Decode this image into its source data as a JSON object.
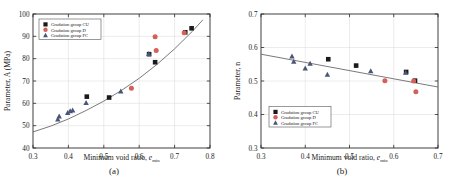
{
  "figure": {
    "panels": [
      {
        "id": "a",
        "caption": "(a)",
        "xlabel_main": "Minimum void ratio, ",
        "xlabel_sym": "e",
        "xlabel_sub": "min",
        "ylabel": "Parameter, A (MPa)",
        "xticks": [
          "0.3",
          "0.4",
          "0.5",
          "0.6",
          "0.7",
          "0.8"
        ],
        "yticks": [
          "40",
          "50",
          "60",
          "70",
          "80",
          "90",
          "100"
        ],
        "legend": [
          {
            "label": "Gradation group CU",
            "marker": "square",
            "color": "#1a1a1a"
          },
          {
            "label": "Gradation group D",
            "marker": "circle",
            "color": "#d4605a"
          },
          {
            "label": "Gradation group FC",
            "marker": "triangle",
            "color": "#4a5578"
          }
        ]
      },
      {
        "id": "b",
        "caption": "(b)",
        "xlabel_main": "Minimum void ratio, ",
        "xlabel_sym": "e",
        "xlabel_sub": "min",
        "ylabel": "Parameter, n",
        "xticks": [
          "0.3",
          "0.4",
          "0.5",
          "0.6",
          "0.7"
        ],
        "yticks": [
          "0.3",
          "0.4",
          "0.5",
          "0.6",
          "0.7"
        ],
        "legend": [
          {
            "label": "Gradation group CU",
            "marker": "square",
            "color": "#1a1a1a"
          },
          {
            "label": "Gradation group D",
            "marker": "circle",
            "color": "#d4605a"
          },
          {
            "label": "Gradation group FC",
            "marker": "triangle",
            "color": "#4a5578"
          }
        ]
      }
    ]
  },
  "chart_data": [
    {
      "type": "scatter",
      "panel": "a",
      "title": "",
      "xlabel": "Minimum void ratio, e_min",
      "ylabel": "Parameter, A (MPa)",
      "xlim": [
        0.3,
        0.8
      ],
      "ylim": [
        40,
        100
      ],
      "xticks": [
        0.3,
        0.4,
        0.5,
        0.6,
        0.7,
        0.8
      ],
      "yticks": [
        40,
        50,
        60,
        70,
        80,
        90,
        100
      ],
      "grid": true,
      "legend_position": "upper-left",
      "series": [
        {
          "name": "Gradation group CU",
          "marker": "square",
          "color": "#1a1a1a",
          "points": [
            [
              0.452,
              63.0
            ],
            [
              0.515,
              62.6
            ],
            [
              0.628,
              82.0
            ],
            [
              0.645,
              78.4
            ],
            [
              0.73,
              91.8
            ],
            [
              0.748,
              93.6
            ]
          ]
        },
        {
          "name": "Gradation group D",
          "marker": "circle",
          "color": "#d4605a",
          "points": [
            [
              0.578,
              66.8
            ],
            [
              0.645,
              89.8
            ],
            [
              0.648,
              83.7
            ],
            [
              0.727,
              91.6
            ]
          ]
        },
        {
          "name": "Gradation group FC",
          "marker": "triangle",
          "color": "#4a5578",
          "points": [
            [
              0.37,
              52.8
            ],
            [
              0.374,
              54.2
            ],
            [
              0.398,
              55.8
            ],
            [
              0.405,
              56.6
            ],
            [
              0.412,
              56.9
            ],
            [
              0.45,
              60.2
            ],
            [
              0.548,
              65.4
            ],
            [
              0.627,
              82.2
            ]
          ]
        }
      ],
      "trend": {
        "type": "power",
        "description": "rising convex fit curve",
        "points": [
          [
            0.3,
            47.2
          ],
          [
            0.35,
            49.8
          ],
          [
            0.4,
            53.0
          ],
          [
            0.45,
            56.8
          ],
          [
            0.5,
            61.0
          ],
          [
            0.55,
            65.8
          ],
          [
            0.6,
            71.2
          ],
          [
            0.65,
            77.4
          ],
          [
            0.7,
            84.4
          ],
          [
            0.75,
            92.2
          ],
          [
            0.78,
            97.4
          ]
        ]
      }
    },
    {
      "type": "scatter",
      "panel": "b",
      "title": "",
      "xlabel": "Minimum void ratio, e_min",
      "ylabel": "Parameter, n",
      "xlim": [
        0.3,
        0.7
      ],
      "ylim": [
        0.3,
        0.7
      ],
      "xticks": [
        0.3,
        0.4,
        0.5,
        0.6,
        0.7
      ],
      "yticks": [
        0.3,
        0.4,
        0.5,
        0.6,
        0.7
      ],
      "grid": true,
      "legend_position": "lower-left",
      "series": [
        {
          "name": "Gradation group CU",
          "marker": "square",
          "color": "#1a1a1a",
          "points": [
            [
              0.452,
              0.565
            ],
            [
              0.515,
              0.546
            ],
            [
              0.628,
              0.527
            ],
            [
              0.648,
              0.501
            ]
          ]
        },
        {
          "name": "Gradation group D",
          "marker": "circle",
          "color": "#d4605a",
          "points": [
            [
              0.58,
              0.501
            ],
            [
              0.645,
              0.5
            ],
            [
              0.65,
              0.468
            ]
          ]
        },
        {
          "name": "Gradation group FC",
          "marker": "triangle",
          "color": "#4a5578",
          "points": [
            [
              0.37,
              0.574
            ],
            [
              0.374,
              0.558
            ],
            [
              0.4,
              0.538
            ],
            [
              0.411,
              0.552
            ],
            [
              0.45,
              0.519
            ],
            [
              0.548,
              0.53
            ],
            [
              0.627,
              0.525
            ]
          ]
        }
      ],
      "trend": {
        "type": "linear",
        "description": "declining straight fit line",
        "points": [
          [
            0.3,
            0.58
          ],
          [
            0.7,
            0.482
          ]
        ]
      }
    }
  ]
}
